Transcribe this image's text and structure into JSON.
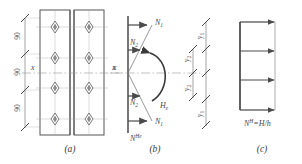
{
  "figure": {
    "panels": [
      {
        "id": "a",
        "caption": "(a)",
        "description": "Two cover plates with four diamond bolt symbols each",
        "axis_label_left": "x",
        "axis_label_right": "x",
        "dimensions": [
          "90",
          "90",
          "90"
        ],
        "bolt_rows": 4,
        "plate_count": 2
      },
      {
        "id": "b",
        "caption": "(b)",
        "description": "Force vectors and moment on vertical bolt line",
        "force_top_outer": "N",
        "force_top_outer_sub": "1",
        "force_top_inner": "N",
        "force_top_inner_sub": "2",
        "force_bottom_inner": "N",
        "force_bottom_inner_sub": "2",
        "force_bottom_outer": "N",
        "force_bottom_outer_sub": "1",
        "moment": "H",
        "moment_sub": "e",
        "base_force": "N",
        "base_force_sup": "He",
        "distance_outer_top": "y",
        "distance_outer_top_sub": "1",
        "distance_inner_top": "y",
        "distance_inner_top_sub": "2",
        "distance_inner_bottom": "y",
        "distance_inner_bottom_sub": "2",
        "distance_outer_bottom": "y",
        "distance_outer_bottom_sub": "1"
      },
      {
        "id": "c",
        "caption": "(c)",
        "description": "Uniform horizontal shear distribution",
        "formula_lead": "N",
        "formula_sup": "H",
        "formula_rest": "=H/h",
        "arrow_count": 3
      }
    ],
    "colors": {
      "line": "#4a4a4a",
      "plate_edge": "#555555",
      "centerline": "#999999",
      "text": "#3a3a3a",
      "hatch": "#7a7a7a"
    }
  }
}
